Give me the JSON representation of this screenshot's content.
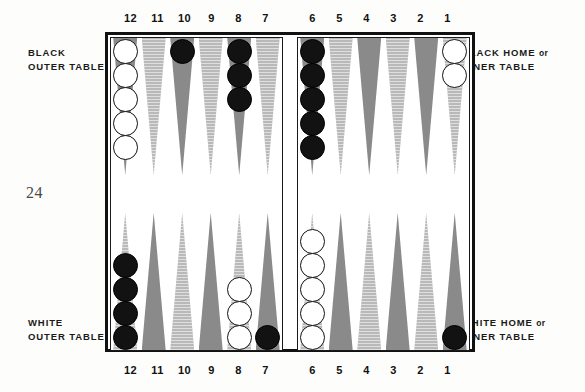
{
  "page_number": "24",
  "labels": {
    "black_outer": {
      "line1": "BLACK",
      "line2": "OUTER TABLE"
    },
    "white_outer": {
      "line1": "WHITE",
      "line2": "OUTER TABLE"
    },
    "black_home": {
      "line1": "BLACK HOME",
      "conj": "or",
      "line2": "INNER TABLE"
    },
    "white_home": {
      "line1": "WHITE HOME",
      "conj": "or",
      "line2": "INNER TABLE"
    }
  },
  "point_numbers": {
    "left_half": [
      "12",
      "11",
      "10",
      "9",
      "8",
      "7"
    ],
    "right_half": [
      "6",
      "5",
      "4",
      "3",
      "2",
      "1"
    ]
  },
  "board": {
    "quadrants": {
      "top_left": {
        "name": "black-outer-table",
        "points": [
          {
            "number": "12",
            "shade": "dark",
            "checkers": {
              "color": "white",
              "count": 5
            }
          },
          {
            "number": "11",
            "shade": "light",
            "checkers": {
              "color": "none",
              "count": 0
            }
          },
          {
            "number": "10",
            "shade": "dark",
            "checkers": {
              "color": "black",
              "count": 1
            }
          },
          {
            "number": "9",
            "shade": "light",
            "checkers": {
              "color": "none",
              "count": 0
            }
          },
          {
            "number": "8",
            "shade": "dark",
            "checkers": {
              "color": "black",
              "count": 3
            }
          },
          {
            "number": "7",
            "shade": "light",
            "checkers": {
              "color": "none",
              "count": 0
            }
          }
        ]
      },
      "top_right": {
        "name": "black-home-inner-table",
        "points": [
          {
            "number": "6",
            "shade": "dark",
            "checkers": {
              "color": "black",
              "count": 5
            }
          },
          {
            "number": "5",
            "shade": "light",
            "checkers": {
              "color": "none",
              "count": 0
            }
          },
          {
            "number": "4",
            "shade": "dark",
            "checkers": {
              "color": "none",
              "count": 0
            }
          },
          {
            "number": "3",
            "shade": "light",
            "checkers": {
              "color": "none",
              "count": 0
            }
          },
          {
            "number": "2",
            "shade": "dark",
            "checkers": {
              "color": "none",
              "count": 0
            }
          },
          {
            "number": "1",
            "shade": "light",
            "checkers": {
              "color": "white",
              "count": 2
            }
          }
        ]
      },
      "bottom_left": {
        "name": "white-outer-table",
        "points": [
          {
            "number": "12",
            "shade": "light",
            "checkers": {
              "color": "black",
              "count": 4
            }
          },
          {
            "number": "11",
            "shade": "dark",
            "checkers": {
              "color": "none",
              "count": 0
            }
          },
          {
            "number": "10",
            "shade": "light",
            "checkers": {
              "color": "none",
              "count": 0
            }
          },
          {
            "number": "9",
            "shade": "dark",
            "checkers": {
              "color": "none",
              "count": 0
            }
          },
          {
            "number": "8",
            "shade": "light",
            "checkers": {
              "color": "white",
              "count": 3
            }
          },
          {
            "number": "7",
            "shade": "dark",
            "checkers": {
              "color": "black",
              "count": 1
            }
          }
        ]
      },
      "bottom_right": {
        "name": "white-home-inner-table",
        "points": [
          {
            "number": "6",
            "shade": "light",
            "checkers": {
              "color": "white",
              "count": 5
            }
          },
          {
            "number": "5",
            "shade": "dark",
            "checkers": {
              "color": "none",
              "count": 0
            }
          },
          {
            "number": "4",
            "shade": "light",
            "checkers": {
              "color": "none",
              "count": 0
            }
          },
          {
            "number": "3",
            "shade": "dark",
            "checkers": {
              "color": "none",
              "count": 0
            }
          },
          {
            "number": "2",
            "shade": "light",
            "checkers": {
              "color": "none",
              "count": 0
            }
          },
          {
            "number": "1",
            "shade": "dark",
            "checkers": {
              "color": "black",
              "count": 1
            }
          }
        ]
      }
    }
  },
  "colors": {
    "checker_white": "#ffffff",
    "checker_black": "#121212",
    "point_dark": "#8a8a8a",
    "point_light": "#b9b9b9",
    "border": "#111111",
    "page_number": "#4a4a4a"
  }
}
